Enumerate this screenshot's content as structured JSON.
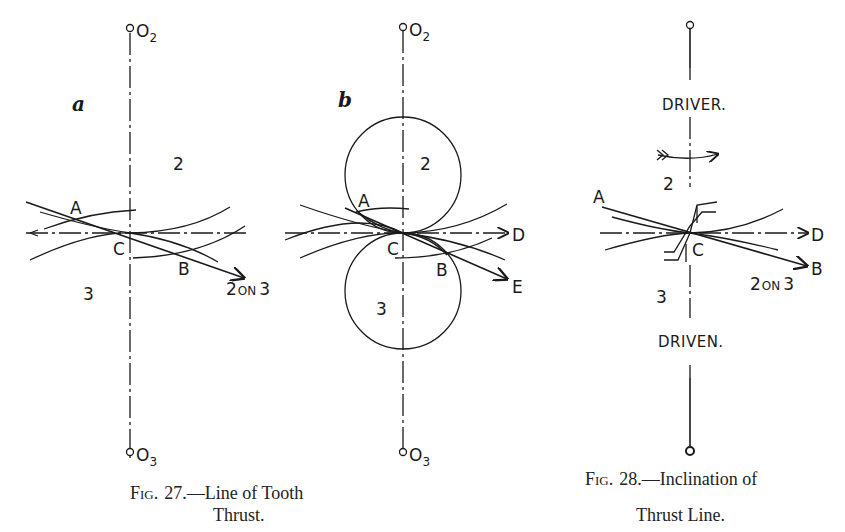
{
  "figure27": {
    "panel_a": {
      "panel_label": "a",
      "top_center_label": "O",
      "top_center_sub": "2",
      "bottom_center_label": "O",
      "bottom_center_sub": "3",
      "region_upper": "2",
      "region_lower": "3",
      "point_a": "A",
      "point_b": "B",
      "point_c": "C",
      "thrust_label": "2 ON 3",
      "thrust_label_big1": "2",
      "thrust_label_small": "ON",
      "thrust_label_big2": "3"
    },
    "panel_b": {
      "panel_label": "b",
      "top_center_label": "O",
      "top_center_sub": "2",
      "bottom_center_label": "O",
      "bottom_center_sub": "3",
      "region_upper": "2",
      "region_lower": "3",
      "point_a": "A",
      "point_b": "B",
      "point_c": "C",
      "point_d": "D",
      "point_e": "E"
    },
    "caption_prefix": "Fig.",
    "caption_number": "27.",
    "caption_line1": "—Line of Tooth",
    "caption_line2": "Thrust."
  },
  "figure28": {
    "label_driver": "DRIVER.",
    "label_driven": "DRIVEN.",
    "region_upper": "2",
    "region_lower": "3",
    "point_a": "A",
    "point_b": "B",
    "point_c": "C",
    "point_d": "D",
    "thrust_label_big1": "2",
    "thrust_label_small": "ON",
    "thrust_label_big2": "3",
    "caption_prefix": "Fig.",
    "caption_number": "28.",
    "caption_line1": "—Inclination of",
    "caption_line2": "Thrust Line."
  },
  "colors": {
    "ink": "#1a1a1a",
    "paper": "#ffffff"
  }
}
